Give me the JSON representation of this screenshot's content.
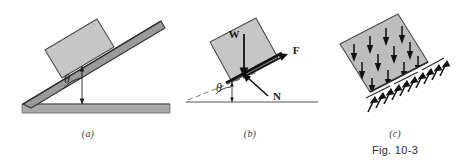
{
  "figure": {
    "number": "Fig. 10-3",
    "panels": [
      {
        "id": "a",
        "caption": "(a)",
        "description": "block resting on an inclined plank raised from horizontal ground",
        "angle_label": "θ",
        "incline_angle_deg": 22,
        "colors": {
          "block_fill": "#c6c6c6",
          "block_edge": "#4a4a4a",
          "plank_fill": "#9a9a9a",
          "plank_edge": "#3a3a3a",
          "ground_fill": "#a8a8a8",
          "ground_edge": "#5a5a5a"
        }
      },
      {
        "id": "b",
        "caption": "(b)",
        "description": "free-body diagram of the block with weight, friction and normal forces",
        "angle_label": "θ",
        "incline_angle_deg": 22,
        "vectors": [
          {
            "name": "weight",
            "label": "W",
            "direction": "down"
          },
          {
            "name": "friction",
            "label": "F",
            "direction": "up-incline"
          },
          {
            "name": "normal",
            "label": "N",
            "direction": "perpendicular-to-incline"
          }
        ],
        "colors": {
          "block_fill": "#c6c6c6",
          "block_edge": "#4a4a4a",
          "arrow": "#111111",
          "dashed_line": "#777777",
          "ground_line": "#555555"
        }
      },
      {
        "id": "c",
        "caption": "(c)",
        "description": "tilted block showing distributed downward weight arrows inside and distributed upward normal force arrows along the base",
        "arrow_sets": [
          {
            "name": "distributed-weight",
            "direction": "down",
            "count": 12
          },
          {
            "name": "distributed-normal",
            "direction": "up-perpendicular",
            "count": 13
          }
        ],
        "colors": {
          "block_fill": "#bdbdbd",
          "block_edge": "#4a4a4a",
          "arrow": "#111111"
        }
      }
    ]
  }
}
